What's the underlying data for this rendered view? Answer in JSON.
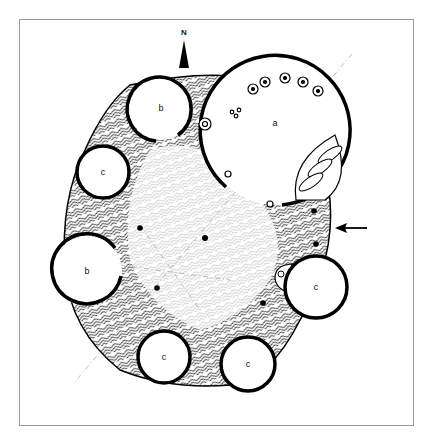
{
  "diagram": {
    "type": "archaeological site plan",
    "north_label": "N",
    "rooms": [
      {
        "id": "room-a",
        "label": "a",
        "cx": 277,
        "cy": 123,
        "r": 77
      },
      {
        "id": "room-b-north",
        "label": "b",
        "cx": 161,
        "cy": 108,
        "r": 33
      },
      {
        "id": "room-c-west",
        "label": "c",
        "cx": 103,
        "cy": 172,
        "r": 27
      },
      {
        "id": "room-b-west",
        "label": "b",
        "cx": 87,
        "cy": 271,
        "r": 36
      },
      {
        "id": "room-c-east",
        "label": "c",
        "cx": 316,
        "cy": 287,
        "r": 32
      },
      {
        "id": "room-c-south-west",
        "label": "c",
        "cx": 164,
        "cy": 357,
        "r": 27
      },
      {
        "id": "room-c-south-east",
        "label": "c",
        "cx": 248,
        "cy": 364,
        "r": 28
      }
    ],
    "entrance_arrow": "arrow-pointing-west",
    "colors": {
      "ink": "#000000",
      "frame": "#999999",
      "axis": "#aaaaaa",
      "background": "#ffffff"
    }
  }
}
